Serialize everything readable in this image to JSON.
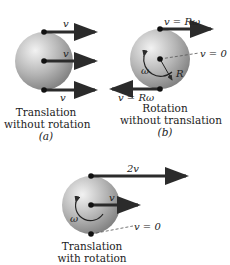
{
  "panels": [
    {
      "id": "a",
      "caption_line1": "Translation",
      "caption_line2": "without rotation",
      "sublabel": "(a)",
      "labels": {
        "top": "v",
        "center": "v",
        "bottom": "v"
      }
    },
    {
      "id": "b",
      "caption_line1": "Rotation",
      "caption_line2": "without translation",
      "sublabel": "(b)",
      "labels": {
        "top": "v = Rω",
        "right": "v = 0",
        "bottom": "v = Rω",
        "radius": "R",
        "omega": "ω"
      }
    },
    {
      "id": "c",
      "caption_line1": "Translation",
      "caption_line2": "with rotation",
      "labels": {
        "top": "2v",
        "center": "v",
        "right": "v = 0",
        "omega": "ω"
      }
    }
  ],
  "colors": {
    "sphere_light": "#e6e6e6",
    "sphere_dark": "#8a8a8a",
    "arrow": "#2b2b2b"
  }
}
